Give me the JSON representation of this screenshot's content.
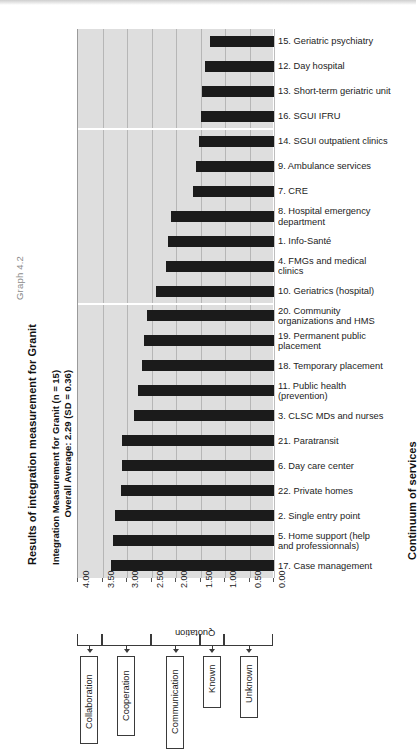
{
  "figure": {
    "graph_number": "Graph 4.2",
    "title": "Results of integration measurement for Granit",
    "subtitle_line1": "Integration Measurement for Granit (n = 15)",
    "subtitle_line2": "Overall Average: 2.29 (SD = 0.36)",
    "right_axis_title": "Continuum of services",
    "x_axis_title": "Quotation"
  },
  "chart_data": {
    "type": "bar",
    "orientation": "horizontal",
    "title": "Results of integration measurement for Granit",
    "subtitle": "Integration Measurement for Granit (n = 15)  Overall Average: 2.29 (SD = 0.36)",
    "xlabel": "Quotation",
    "ylabel": "Continuum of services",
    "xlim": [
      4.0,
      0.0
    ],
    "x_reversed": true,
    "grid": true,
    "legend": "none",
    "overall_average": 2.29,
    "sd": 0.36,
    "n": 15,
    "tick_labels": [
      "4.00",
      "3.50",
      "3.00",
      "2.50",
      "2.00",
      "1.50",
      "1.00",
      "0.50",
      "0.00"
    ],
    "tick_values": [
      4.0,
      3.5,
      3.0,
      2.5,
      2.0,
      1.5,
      1.0,
      0.5,
      0.0
    ],
    "categories": [
      "15. Geriatric psychiatry",
      "12. Day hospital",
      "13. Short-term geriatric unit",
      "16. SGUI IFRU",
      "14. SGUI outpatient clinics",
      "9. Ambulance services",
      "7. CRE",
      "8. Hospital emergency department",
      "1. Info-Santé",
      "4. FMGs and medical clinics",
      "10. Geriatrics (hospital)",
      "20. Community organizations and HMS",
      "19. Permanent public placement",
      "18. Temporary placement",
      "11. Public health (prevention)",
      "3. CLSC MDs and nurses",
      "21. Paratransit",
      "6. Day care center",
      "22. Private homes",
      "2. Single entry point",
      "5. Home support (help and professionnals)",
      "17. Case management"
    ],
    "values": [
      1.3,
      1.4,
      1.46,
      1.5,
      1.54,
      1.6,
      1.66,
      2.1,
      2.16,
      2.2,
      2.4,
      2.6,
      2.66,
      2.7,
      2.78,
      2.86,
      3.1,
      3.1,
      3.12,
      3.24,
      3.28,
      3.32
    ],
    "scale_bands": [
      {
        "label": "Collaboration",
        "from": 4.0,
        "to": 3.5
      },
      {
        "label": "Cooperation",
        "from": 3.5,
        "to": 2.5
      },
      {
        "label": "Communication",
        "from": 2.5,
        "to": 1.5
      },
      {
        "label": "Known",
        "from": 1.5,
        "to": 1.0
      },
      {
        "label": "Unknown",
        "from": 1.0,
        "to": 0.0
      }
    ],
    "group_separators_after_category_index": [
      3,
      10
    ]
  },
  "category_label_lines": [
    [
      "15. Geriatric psychiatry"
    ],
    [
      "12. Day hospital"
    ],
    [
      "13. Short-term geriatric unit"
    ],
    [
      "16. SGUI IFRU"
    ],
    [
      "14. SGUI outpatient clinics"
    ],
    [
      "9. Ambulance services"
    ],
    [
      "7. CRE"
    ],
    [
      "8. Hospital emergency",
      "department"
    ],
    [
      "1. Info-Santé"
    ],
    [
      "4. FMGs and medical",
      "clinics"
    ],
    [
      "10. Geriatrics (hospital)"
    ],
    [
      "20. Community",
      "organizations and HMS"
    ],
    [
      "19. Permanent public",
      "placement"
    ],
    [
      "18. Temporary placement"
    ],
    [
      "11. Public health",
      "(prevention)"
    ],
    [
      "3. CLSC MDs and nurses"
    ],
    [
      "21. Paratransit"
    ],
    [
      "6. Day care center"
    ],
    [
      "22. Private homes"
    ],
    [
      "2. Single entry point"
    ],
    [
      "5. Home support (help",
      "and professionnals)"
    ],
    [
      "17. Case management"
    ]
  ],
  "colors": {
    "bar": "#1b1b1b",
    "plot_background": "#dedede",
    "gridline": "#a8a8a8",
    "text": "#1c1c1c",
    "box_border": "#3a3a3a"
  }
}
